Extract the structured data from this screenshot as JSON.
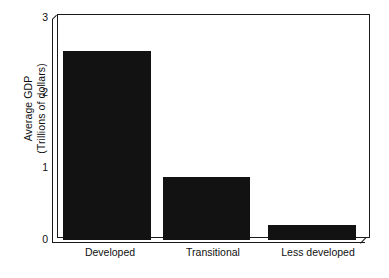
{
  "chart_data": {
    "type": "bar",
    "title": "",
    "subtitle": "",
    "xlabel": "",
    "ylabel": "Average GDP (Trillions of dollars)",
    "ylabel_line1": "Average GDP",
    "ylabel_line2": "(Trillions of dollars)",
    "categories": [
      "Developed",
      "Transitional",
      "Less developed"
    ],
    "values": [
      2.55,
      0.85,
      0.2
    ],
    "ylim": [
      0,
      3
    ],
    "yticks": [
      "0",
      "1",
      "2",
      "3"
    ],
    "ytick_values": [
      0,
      1,
      2,
      3
    ],
    "grid": false,
    "legend": null,
    "legend_position": "none",
    "bar_color": "#121212",
    "axis_color": "#1a1a1a",
    "background_color": "#ffffff"
  },
  "figure": {
    "axis_style": "3d-double-line-frame",
    "y_axis_name": "y-axis",
    "x_axis_name": "x-axis"
  }
}
